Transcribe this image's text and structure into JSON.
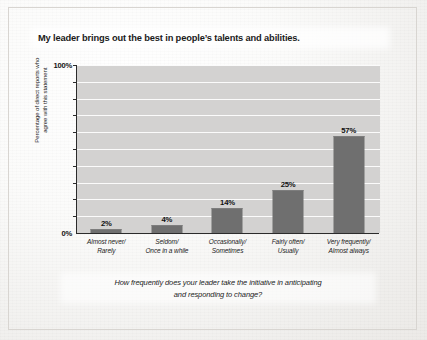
{
  "figure": {
    "title": "My leader brings out the best in people’s talents and abilities.",
    "caption_line1": "How frequently does your leader take the initiative in anticipating",
    "caption_line2": "and responding to change?",
    "ylabel_line1": "Percentage of direct reports who",
    "ylabel_line2": "agree with this statement"
  },
  "axis": {
    "y_top_label": "100%",
    "y_bottom_label": "0%"
  },
  "colors": {
    "bar": "#6f6f6f",
    "plot_background": "#d3d2d1",
    "gridline": "#fdfdfd",
    "axis": "#2b2b2b",
    "text": "#1b1b1b",
    "page": "#f2f1ef"
  },
  "chart_data": {
    "type": "bar",
    "title": "My leader brings out the best in people’s talents and abilities.",
    "xlabel": "How frequently does your leader take the initiative in anticipating and responding to change?",
    "ylabel": "Percentage of direct reports who agree with this statement",
    "categories": [
      "Almost never/ Rarely",
      "Seldom/ Once in a while",
      "Occasionally/ Sometimes",
      "Fairly often/ Usually",
      "Very frequently/ Almost always"
    ],
    "category_lines": [
      [
        "Almost never/",
        "Rarely"
      ],
      [
        "Seldom/",
        "Once in a while"
      ],
      [
        "Occasionally/",
        "Sometimes"
      ],
      [
        "Fairly often/",
        "Usually"
      ],
      [
        "Very frequently/",
        "Almost always"
      ]
    ],
    "values": [
      2,
      4,
      14,
      25,
      57
    ],
    "value_labels": [
      "2%",
      "4%",
      "14%",
      "25%",
      "57%"
    ],
    "ylim": [
      0,
      100
    ],
    "ytick_values": [
      0,
      10,
      20,
      30,
      40,
      50,
      60,
      70,
      80,
      90,
      100
    ],
    "ytick_labels_shown": [
      "0%",
      "100%"
    ],
    "grid": "horizontal",
    "legend": "none"
  }
}
